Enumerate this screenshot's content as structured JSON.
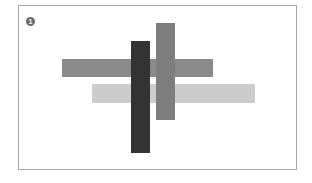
{
  "figure": {
    "badge_label": "1",
    "shapes": [
      {
        "name": "medium-horizontal-bar",
        "color": "#8a8a8a"
      },
      {
        "name": "light-horizontal-bar",
        "color": "#cccccc"
      },
      {
        "name": "dark-vertical-bar",
        "color": "#333333"
      },
      {
        "name": "gray-vertical-bar",
        "color": "#7e7e7e"
      }
    ]
  }
}
